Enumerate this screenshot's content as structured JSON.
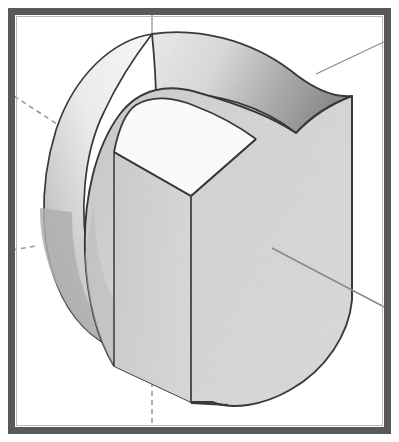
{
  "figure": {
    "domain_note": "engineering drawing",
    "canvas": {
      "width": 399,
      "height": 442,
      "background": "#ffffff"
    },
    "border": {
      "name": "figure-frame",
      "color": "#595959",
      "thickness": 7,
      "inset": 8,
      "inner_hairline_color": "#b8b8b8"
    },
    "palette": {
      "outline": "#3a3a3a",
      "outline_thin": "#4a4a4a",
      "axis_line": "#8a8a8a",
      "axis_dashed": "#9a9a9a",
      "front_face_light": "#d8d8d8",
      "front_face_dark": "#c6c6c6",
      "top_band_light": "#e8e8e8",
      "top_band_dark": "#9e9e9e",
      "back_cyl_light": "#f2f2f2",
      "back_cyl_dark": "#a8a8a8",
      "slot_face": "#cfcfcf",
      "paper_white": "#ffffff"
    },
    "axes": [
      {
        "name": "axis-top-vertical",
        "style": "solid",
        "x1": 152,
        "y1": 9,
        "x2": 152,
        "y2": 36,
        "stroke": "#8a8a8a",
        "width": 1.2
      },
      {
        "name": "axis-upper-right",
        "style": "solid",
        "x1": 316,
        "y1": 74,
        "x2": 390,
        "y2": 39,
        "stroke": "#8a8a8a",
        "width": 1.2
      },
      {
        "name": "axis-lower-right",
        "style": "solid",
        "x1": 272,
        "y1": 248,
        "x2": 390,
        "y2": 310,
        "stroke": "#8a8a8a",
        "width": 1.6
      },
      {
        "name": "axis-upper-left-dashed",
        "style": "dashed",
        "x1": 14,
        "y1": 96,
        "x2": 66,
        "y2": 130,
        "stroke": "#9a9a9a",
        "width": 1.6,
        "dash": "5 4"
      },
      {
        "name": "axis-left-dashed-stub",
        "style": "dashed",
        "x1": 12,
        "y1": 250,
        "x2": 36,
        "y2": 246,
        "stroke": "#9a9a9a",
        "width": 1.6,
        "dash": "5 4"
      },
      {
        "name": "axis-bottom-vertical-dashed",
        "style": "dashed",
        "x1": 152,
        "y1": 382,
        "x2": 152,
        "y2": 432,
        "stroke": "#9a9a9a",
        "width": 1.6,
        "dash": "5 4"
      }
    ],
    "geometry": {
      "back_cylinder_silhouette": "M 152 34 C 110 40 68 82 52 140 C 36 200 44 262 68 300 C 86 328 104 338 120 340",
      "back_cylinder_inner": "M 152 34 C 120 46 92 92 82 146 C 72 204 80 268 104 306 C 120 332 140 344 156 348",
      "top_band": "M 152 34 C 196 28 246 40 286 70 C 312 90 330 100 352 96 L 352 96 C 330 104 310 116 296 132 C 258 100 210 88 168 96 C 162 74 158 52 152 34 Z",
      "front_face_outer": "M 296 132 C 312 118 332 104 352 96 L 352 300 C 348 336 318 376 272 396 C 242 408 216 404 198 394 L 198 394 L 114 365 C 96 340 86 300 84 256 C 82 196 96 142 122 112 C 140 94 164 90 184 96 C 220 104 262 112 296 132 Z",
      "slot_left_edge": {
        "x1": 114,
        "y1": 152,
        "x2": 114,
        "y2": 366
      },
      "slot_mid_edge": {
        "x1": 191,
        "y1": 196,
        "x2": 191,
        "y2": 402
      },
      "slot_top_left_ridge": {
        "x1": 114,
        "y1": 152,
        "x2": 191,
        "y2": 196
      },
      "slot_top_right_ridge": {
        "x1": 191,
        "y1": 196,
        "x2": 254,
        "y2": 140
      },
      "right_vertical_edge": {
        "x1": 352,
        "y1": 96,
        "x2": 352,
        "y2": 300
      },
      "bottom_flat": {
        "x1": 191,
        "y1": 402,
        "x2": 226,
        "y2": 404
      }
    }
  }
}
